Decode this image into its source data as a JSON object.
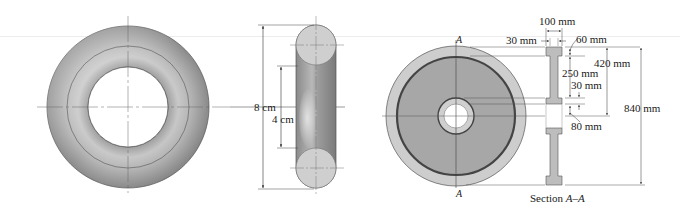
{
  "figure": {
    "views": [
      {
        "id": "torus-top-view",
        "description": "Torus shown in plan view"
      },
      {
        "id": "torus-side-view",
        "description": "Torus shown in elevation view"
      },
      {
        "id": "flywheel-front-view",
        "description": "Flywheel front view with section cut A-A"
      },
      {
        "id": "flywheel-section",
        "description": "Section A-A through flywheel"
      }
    ],
    "torus_dimensions": {
      "outer_diameter": "8 cm",
      "inner_diameter": "4 cm"
    },
    "section_labels": {
      "cut_top": "A",
      "cut_bottom": "A",
      "section_caption_prefix": "Section ",
      "section_caption_name": "A–A"
    },
    "flywheel_dimensions": {
      "total_width": "100 mm",
      "web_thickness": "30 mm",
      "rim_thickness": "60 mm",
      "outer_radius": "420 mm",
      "web_height": "250 mm",
      "hub_thickness": "30 mm",
      "bore_radius": "80 mm",
      "outer_diameter": "840 mm"
    },
    "colors": {
      "torus_light": "#d2d2d2",
      "torus_dark": "#8e8e8e",
      "wheel_rim": "#cfcfcf",
      "wheel_web": "#a6a6a6",
      "wheel_dark_ring": "#5a5a5a",
      "section_fill": "#bdbdbd",
      "line": "#3a3a3a"
    }
  }
}
